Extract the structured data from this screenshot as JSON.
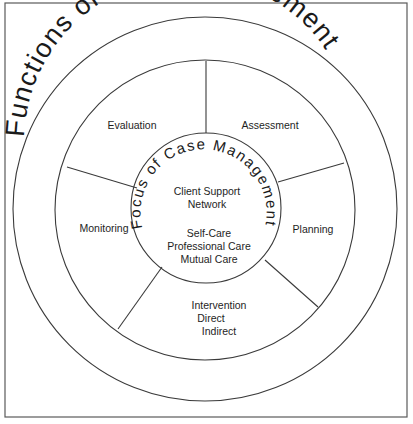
{
  "diagram": {
    "outer_title": "Functions of Case Management",
    "inner_title": "Focus of Case Management",
    "segments": [
      {
        "name": "evaluation",
        "lines": [
          "Evaluation"
        ]
      },
      {
        "name": "assessment",
        "lines": [
          "Assessment"
        ]
      },
      {
        "name": "planning",
        "lines": [
          "Planning"
        ]
      },
      {
        "name": "intervention",
        "lines": [
          "Intervention",
          "Direct",
          "Indirect"
        ]
      },
      {
        "name": "monitoring",
        "lines": [
          "Monitoring"
        ]
      }
    ],
    "center": {
      "group1": [
        "Client Support",
        "Network"
      ],
      "group2": [
        "Self-Care",
        "Professional Care",
        "Mutual Care"
      ]
    },
    "colors": {
      "line": "#3a3a3a",
      "text": "#1a1a1a",
      "background": "#ffffff"
    }
  }
}
